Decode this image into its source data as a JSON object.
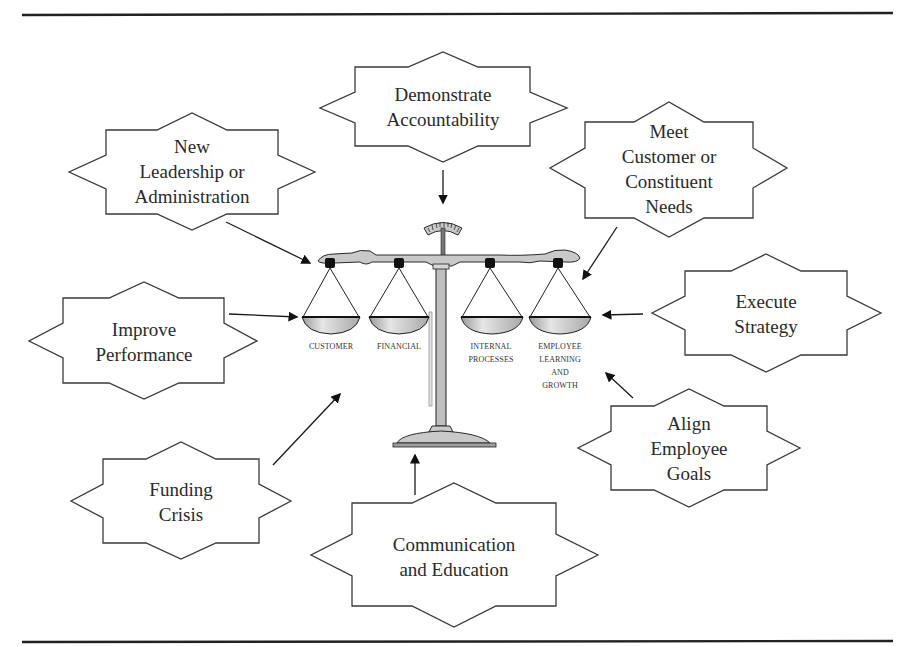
{
  "figure": {
    "type": "balanced-scorecard-drivers-diagram",
    "center": {
      "name": "scale",
      "pans": [
        {
          "id": "customer",
          "label_lines": [
            "CUSTOMER"
          ]
        },
        {
          "id": "financial",
          "label_lines": [
            "FINANCIAL"
          ]
        },
        {
          "id": "internal",
          "label_lines": [
            "INTERNAL",
            "PROCESSES"
          ]
        },
        {
          "id": "employee",
          "label_lines": [
            "EMPLOYEE",
            "LEARNING",
            "AND",
            "GROWTH"
          ]
        }
      ]
    },
    "drivers": [
      {
        "id": "demonstrate-accountability",
        "lines": [
          "Demonstrate",
          "Accountability"
        ]
      },
      {
        "id": "new-leadership",
        "lines": [
          "New",
          "Leadership or",
          "Administration"
        ]
      },
      {
        "id": "meet-customer-needs",
        "lines": [
          "Meet",
          "Customer or",
          "Constituent",
          "Needs"
        ]
      },
      {
        "id": "improve-performance",
        "lines": [
          "Improve",
          "Performance"
        ]
      },
      {
        "id": "execute-strategy",
        "lines": [
          "Execute",
          "Strategy"
        ]
      },
      {
        "id": "align-employee-goals",
        "lines": [
          "Align",
          "Employee",
          "Goals"
        ]
      },
      {
        "id": "funding-crisis",
        "lines": [
          "Funding",
          "Crisis"
        ]
      },
      {
        "id": "communication-education",
        "lines": [
          "Communication",
          "and Education"
        ]
      }
    ]
  }
}
